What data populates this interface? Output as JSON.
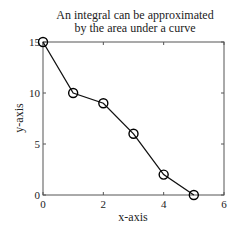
{
  "chart_data": {
    "type": "line",
    "title": "An integral can be approximated by the area under a curve",
    "title_lines": [
      "An integral can be approximated",
      "by the area under a curve"
    ],
    "xlabel": "x-axis",
    "ylabel": "y-axis",
    "x": [
      0,
      1,
      2,
      3,
      4,
      5
    ],
    "series": [
      {
        "name": "curve",
        "values": [
          15,
          10,
          9,
          6,
          2,
          0
        ],
        "marker": "circle",
        "color": "#000000"
      }
    ],
    "xlim": [
      0,
      6
    ],
    "ylim": [
      0,
      15
    ],
    "xticks": [
      "0",
      "2",
      "4",
      "6"
    ],
    "yticks": [
      "0",
      "5",
      "10",
      "15"
    ],
    "grid": false,
    "legend": null
  }
}
